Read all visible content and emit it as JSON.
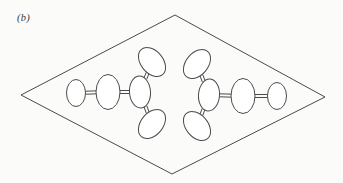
{
  "figure": {
    "panel_label": "(b)",
    "caption_label_style": "italic",
    "background_color": "#fbfbfa",
    "stroke_color": "#4a4a4a",
    "fill_color": "#ffffff",
    "width": 343,
    "height": 183
  },
  "diagram": {
    "type": "molecular-schematic",
    "outline": {
      "name": "rhombus-plane",
      "shape": "rhombus",
      "stroke_width": 1,
      "vertices": [
        {
          "label": "top",
          "x": 175,
          "y": 15
        },
        {
          "label": "right",
          "x": 325,
          "y": 97
        },
        {
          "label": "bottom",
          "x": 172,
          "y": 174
        },
        {
          "label": "left",
          "x": 21,
          "y": 95
        }
      ]
    },
    "units": [
      {
        "name": "left-unit",
        "orientation": "branches-on-right",
        "ellipses": [
          {
            "id": "L1",
            "role": "terminal-atom",
            "cx": 76,
            "cy": 93,
            "rx": 9.5,
            "ry": 13.5,
            "rotation": 0
          },
          {
            "id": "L2",
            "role": "chain-atom",
            "cx": 108,
            "cy": 92,
            "rx": 12,
            "ry": 17.5,
            "rotation": 0
          },
          {
            "id": "L3",
            "role": "junction-atom",
            "cx": 140,
            "cy": 92,
            "rx": 10.5,
            "ry": 16,
            "rotation": -4
          },
          {
            "id": "L4",
            "role": "branch-atom-upper",
            "cx": 152,
            "cy": 62,
            "rx": 11,
            "ry": 16.5,
            "rotation": -40
          },
          {
            "id": "L5",
            "role": "branch-atom-lower",
            "cx": 152,
            "cy": 124,
            "rx": 11,
            "ry": 16.5,
            "rotation": 40
          }
        ],
        "bonds": [
          {
            "id": "LB1",
            "from": "L1",
            "to": "L2",
            "style": "double"
          },
          {
            "id": "LB2",
            "from": "L2",
            "to": "L3",
            "style": "double"
          },
          {
            "id": "LB3",
            "from": "L3",
            "to": "L4",
            "style": "double"
          },
          {
            "id": "LB4",
            "from": "L3",
            "to": "L5",
            "style": "double"
          }
        ]
      },
      {
        "name": "right-unit",
        "orientation": "branches-on-left",
        "ellipses": [
          {
            "id": "R1",
            "role": "terminal-atom",
            "cx": 277,
            "cy": 96,
            "rx": 9.5,
            "ry": 13.5,
            "rotation": 0
          },
          {
            "id": "R2",
            "role": "chain-atom",
            "cx": 243,
            "cy": 96,
            "rx": 12,
            "ry": 17.5,
            "rotation": 0
          },
          {
            "id": "R3",
            "role": "junction-atom",
            "cx": 209,
            "cy": 95,
            "rx": 10.5,
            "ry": 16,
            "rotation": 4
          },
          {
            "id": "R4",
            "role": "branch-atom-upper",
            "cx": 197,
            "cy": 64,
            "rx": 11,
            "ry": 16.5,
            "rotation": 40
          },
          {
            "id": "R5",
            "role": "branch-atom-lower",
            "cx": 197,
            "cy": 126,
            "rx": 11,
            "ry": 16.5,
            "rotation": -40
          }
        ],
        "bonds": [
          {
            "id": "RB1",
            "from": "R1",
            "to": "R2",
            "style": "double"
          },
          {
            "id": "RB2",
            "from": "R2",
            "to": "R3",
            "style": "double"
          },
          {
            "id": "RB3",
            "from": "R3",
            "to": "R4",
            "style": "double"
          },
          {
            "id": "RB4",
            "from": "R3",
            "to": "R5",
            "style": "double"
          }
        ]
      }
    ]
  }
}
